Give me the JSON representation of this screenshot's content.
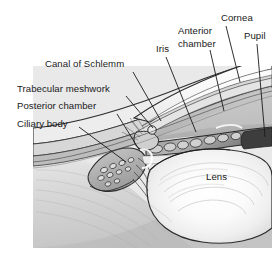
{
  "figure": {
    "style": "grayscale medical illustration",
    "width": 279,
    "height": 258,
    "background_color": "#ffffff",
    "label_color": "#1a1a1a",
    "leader_line_color": "#1a1a1a"
  },
  "labels": [
    {
      "id": "canal-of-schlemm",
      "text": "Canal of Schlemm",
      "x": 45,
      "y": 58,
      "align": "left",
      "leader": {
        "x1": 133,
        "y1": 72,
        "x2": 161,
        "y2": 121
      }
    },
    {
      "id": "trabecular-meshwork",
      "text": "Trabecular meshwork",
      "x": 17,
      "y": 83,
      "align": "left",
      "leader": {
        "x1": 126,
        "y1": 96,
        "x2": 153,
        "y2": 128
      }
    },
    {
      "id": "posterior-chamber",
      "text": "Posterior chamber",
      "x": 17,
      "y": 100,
      "align": "left",
      "leader": {
        "x1": 117,
        "y1": 114,
        "x2": 140,
        "y2": 151
      }
    },
    {
      "id": "ciliary-body",
      "text": "Ciliary body",
      "x": 17,
      "y": 118,
      "align": "left",
      "leader": {
        "x1": 79,
        "y1": 127,
        "x2": 126,
        "y2": 162
      }
    },
    {
      "id": "iris",
      "text": "Iris",
      "x": 156,
      "y": 43,
      "align": "left",
      "leader": {
        "x1": 166,
        "y1": 57,
        "x2": 196,
        "y2": 132
      }
    },
    {
      "id": "anterior-chamber",
      "text": "Anterior\nchamber",
      "line1": "Anterior",
      "line2": "chamber",
      "x": 178,
      "y": 24,
      "align": "left",
      "leader": {
        "x1": 210,
        "y1": 50,
        "x2": 224,
        "y2": 111
      }
    },
    {
      "id": "cornea",
      "text": "Cornea",
      "x": 221,
      "y": 12,
      "align": "left",
      "leader": {
        "x1": 226,
        "y1": 26,
        "x2": 240,
        "y2": 82
      }
    },
    {
      "id": "pupil",
      "text": "Pupil",
      "x": 244,
      "y": 30,
      "align": "left",
      "leader": {
        "x1": 257,
        "y1": 44,
        "x2": 265,
        "y2": 137
      }
    },
    {
      "id": "lens",
      "text": "Lens",
      "x": 206,
      "y": 171,
      "align": "left",
      "leader": null
    }
  ],
  "illustration": {
    "panel": {
      "x": 33,
      "y": 66,
      "width": 239,
      "height": 182
    },
    "structures": [
      "cornea",
      "sclera",
      "anterior-chamber",
      "posterior-chamber",
      "iris",
      "pupil",
      "lens",
      "ciliary-body",
      "trabecular-meshwork",
      "canal-of-schlemm",
      "zonule-fibers"
    ],
    "palette": {
      "cornea_light": "#f2f2f2",
      "sclera_mid": "#d8d8d8",
      "chamber_fill": "#bfbfbf",
      "iris_dark": "#4a4a4a",
      "lens_light": "#fafafa",
      "ciliary_mid": "#a8a8a8",
      "outline": "#2b2b2b"
    }
  }
}
